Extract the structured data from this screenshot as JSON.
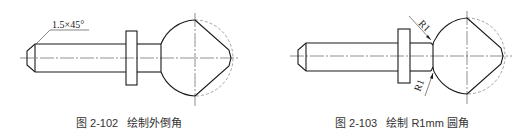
{
  "figures": [
    {
      "id": "fig-2-102",
      "annotation": "1.5×45°",
      "caption": "图 2-102   绘制外倒角"
    },
    {
      "id": "fig-2-103",
      "annotations": [
        "R1",
        "R1"
      ],
      "caption": "图 2-103   绘制 R1mm 圆角"
    }
  ],
  "colors": {
    "line": "#1a1a1a",
    "centerline": "#444444",
    "caption": "#333333"
  }
}
